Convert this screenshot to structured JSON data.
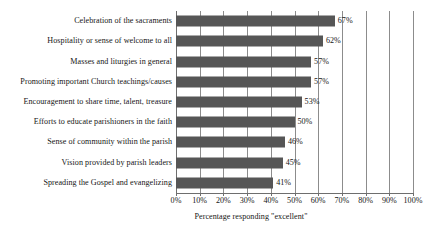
{
  "chart_data": {
    "type": "bar",
    "orientation": "horizontal",
    "title": "",
    "xlabel": "Percentage responding \"excellent\"",
    "ylabel": "",
    "xlim": [
      0,
      100
    ],
    "grid": true,
    "legend": false,
    "legend_position": "none",
    "bar_color": "#565656",
    "gridline_color": "#8c8c8c",
    "axis_color": "#6e6e6e",
    "value_suffix": "%",
    "xticks": [
      0,
      10,
      20,
      30,
      40,
      50,
      60,
      70,
      80,
      90,
      100
    ],
    "xticklabels": [
      "0%",
      "10%",
      "20%",
      "30%",
      "40%",
      "50%",
      "60%",
      "70%",
      "80%",
      "90%",
      "100%"
    ],
    "categories": [
      "Celebration of the sacraments",
      "Hospitality or sense of welcome to all",
      "Masses and liturgies in general",
      "Promoting important Church teachings/causes",
      "Encouragement to share time, talent, treasure",
      "Efforts to educate parishioners in the faith",
      "Sense of community within the parish",
      "Vision provided by parish leaders",
      "Spreading the Gospel and evangelizing"
    ],
    "values": [
      67,
      62,
      57,
      57,
      53,
      50,
      46,
      45,
      41
    ],
    "value_labels": [
      "67%",
      "62%",
      "57%",
      "57%",
      "53%",
      "50%",
      "46%",
      "45%",
      "41%"
    ]
  }
}
